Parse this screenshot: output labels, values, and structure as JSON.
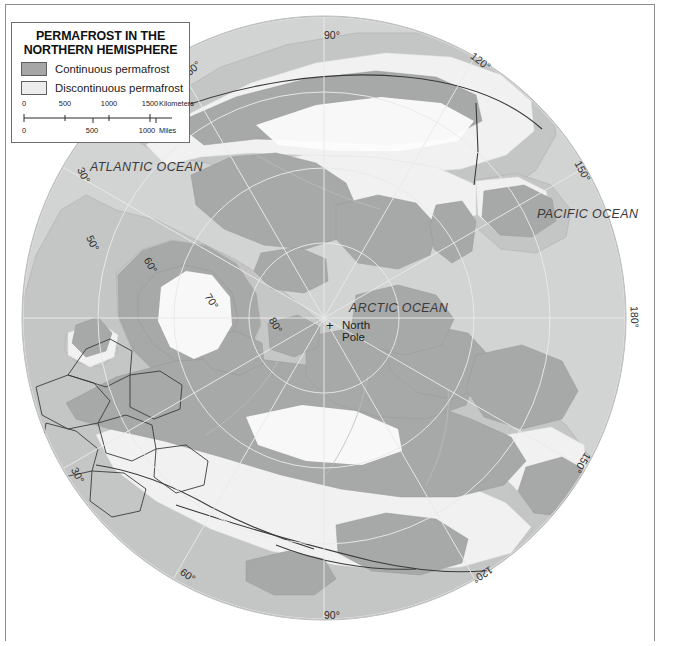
{
  "legend": {
    "title_line1": "PERMAFROST IN THE",
    "title_line2": "NORTHERN HEMISPHERE",
    "items": [
      {
        "label": "Continuous permafrost",
        "swatch": "continuous",
        "color": "#a6a6a6"
      },
      {
        "label": "Discontinuous permafrost",
        "swatch": "discontinuous",
        "color": "#ececec"
      }
    ]
  },
  "scalebar": {
    "km": {
      "ticks": [
        "0",
        "500",
        "1000",
        "1500"
      ],
      "unit": "Kilometers"
    },
    "miles": {
      "ticks": [
        "0",
        "500",
        "1000"
      ],
      "unit": "Miles"
    }
  },
  "map": {
    "projection": "polar-azimuthal",
    "center_label": "North\nPole",
    "pole_marker": "+",
    "oceans": [
      {
        "name": "ARCTIC OCEAN",
        "x": 345,
        "y": 303
      },
      {
        "name": "ATLANTIC OCEAN",
        "x": 86,
        "y": 162
      },
      {
        "name": "PACIFIC OCEAN",
        "x": 533,
        "y": 208
      }
    ],
    "pole": {
      "label_line1": "North",
      "label_line2": "Pole",
      "x": 337,
      "y": 321
    },
    "graticule_labels": [
      {
        "text": "90°",
        "x": 324,
        "y": 31,
        "rot": 0
      },
      {
        "text": "120°",
        "x": 470,
        "y": 58,
        "rot": 38
      },
      {
        "text": "150°",
        "x": 571,
        "y": 168,
        "rot": 62
      },
      {
        "text": "180°",
        "x": 624,
        "y": 315,
        "rot": 88
      },
      {
        "text": "150°",
        "x": 573,
        "y": 462,
        "rot": 122
      },
      {
        "text": "120°",
        "x": 474,
        "y": 573,
        "rot": 147
      },
      {
        "text": "90°",
        "x": 325,
        "y": 611,
        "rot": 0
      },
      {
        "text": "60°",
        "x": 180,
        "y": 573,
        "rot": 35
      },
      {
        "text": "30°",
        "x": 70,
        "y": 472,
        "rot": 62
      },
      {
        "text": "30°",
        "x": 76,
        "y": 172,
        "rot": 65
      },
      {
        "text": "50°",
        "x": 85,
        "y": 240,
        "rot": 65
      },
      {
        "text": "60°",
        "x": 143,
        "y": 262,
        "rot": 60
      },
      {
        "text": "70°",
        "x": 204,
        "y": 298,
        "rot": 58
      },
      {
        "text": "80°",
        "x": 268,
        "y": 322,
        "rot": 60
      },
      {
        "text": "60°",
        "x": 185,
        "y": 65,
        "rot": 318
      }
    ]
  },
  "colors": {
    "ocean": "#d2d3d3",
    "land": "#c3c4c4",
    "continuous_permafrost": "#a6a6a6",
    "discontinuous_permafrost": "#f0f0f0",
    "ice": "#ffffff",
    "border_line": "#3b3b3b",
    "graticule": "#e8e8e8",
    "frame": "#8d8d8d"
  }
}
